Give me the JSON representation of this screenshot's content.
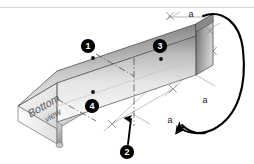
{
  "figure": {
    "kind": "isometric-technical-diagram",
    "background_color": "#ffffff",
    "top_rule_color": "#d8d8d8"
  },
  "face_labels": {
    "bottom": "Bottom",
    "view": "view"
  },
  "dimensions": [
    {
      "id": "dim-top",
      "label": "a"
    },
    {
      "id": "dim-ground-right",
      "label": "a"
    },
    {
      "id": "dim-ground-front",
      "label": "a"
    }
  ],
  "callouts": [
    {
      "id": "callout-1",
      "number": "1"
    },
    {
      "id": "callout-2",
      "number": "2"
    },
    {
      "id": "callout-3",
      "number": "3"
    },
    {
      "id": "callout-4",
      "number": "4"
    }
  ],
  "annotations": {
    "rotation_arrow": "curved-rotation-arrow",
    "ground_arrow": "short-curved-arrow",
    "leader_arrow": "callout-2-leader-arrow",
    "centerline": "dash-dot-centerline"
  },
  "colors": {
    "metal_dark": "#6f6f6f",
    "metal_mid": "#bdbdbd",
    "metal_light": "#f4f4f4",
    "outline": "#3a3a3a",
    "dimension_line": "#9a9a9a",
    "callout_fill": "#000000",
    "callout_text": "#ffffff",
    "arrow": "#000000"
  }
}
